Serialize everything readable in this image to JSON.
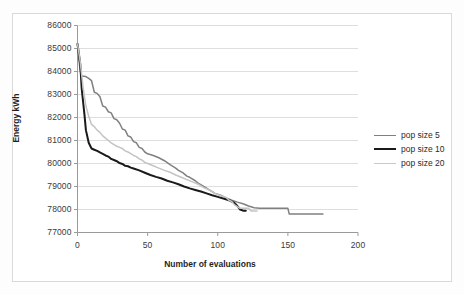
{
  "chart_data": {
    "type": "line",
    "title": "",
    "xlabel": "Number of evaluations",
    "ylabel": "Energy kWh",
    "xlim": [
      0,
      200
    ],
    "ylim": [
      77000,
      86000
    ],
    "xticks": [
      0,
      50,
      100,
      150,
      200
    ],
    "yticks": [
      77000,
      78000,
      79000,
      80000,
      81000,
      82000,
      83000,
      84000,
      85000,
      86000
    ],
    "grid": "horizontal",
    "legend_position": "right",
    "series": [
      {
        "name": "pop size 5",
        "color": "#808080",
        "width": 1.5,
        "points": [
          [
            0,
            85200
          ],
          [
            1,
            84500
          ],
          [
            2,
            84000
          ],
          [
            3,
            83800
          ],
          [
            6,
            83780
          ],
          [
            8,
            83700
          ],
          [
            10,
            83600
          ],
          [
            12,
            83100
          ],
          [
            14,
            83050
          ],
          [
            16,
            82900
          ],
          [
            18,
            82500
          ],
          [
            20,
            82450
          ],
          [
            22,
            82250
          ],
          [
            24,
            82200
          ],
          [
            26,
            81950
          ],
          [
            28,
            81900
          ],
          [
            30,
            81750
          ],
          [
            32,
            81500
          ],
          [
            34,
            81450
          ],
          [
            36,
            81200
          ],
          [
            38,
            81150
          ],
          [
            40,
            80950
          ],
          [
            42,
            80900
          ],
          [
            44,
            80700
          ],
          [
            46,
            80650
          ],
          [
            48,
            80500
          ],
          [
            50,
            80420
          ],
          [
            54,
            80350
          ],
          [
            58,
            80250
          ],
          [
            62,
            80120
          ],
          [
            66,
            79950
          ],
          [
            70,
            79800
          ],
          [
            72,
            79700
          ],
          [
            75,
            79600
          ],
          [
            78,
            79450
          ],
          [
            80,
            79400
          ],
          [
            84,
            79250
          ],
          [
            86,
            79150
          ],
          [
            90,
            79000
          ],
          [
            94,
            78850
          ],
          [
            98,
            78700
          ],
          [
            102,
            78620
          ],
          [
            106,
            78500
          ],
          [
            110,
            78400
          ],
          [
            114,
            78320
          ],
          [
            118,
            78250
          ],
          [
            122,
            78150
          ],
          [
            126,
            78080
          ],
          [
            130,
            78050
          ],
          [
            150,
            78050
          ],
          [
            151,
            77800
          ],
          [
            175,
            77800
          ]
        ]
      },
      {
        "name": "pop size 10",
        "color": "#1a1a1a",
        "width": 2.0,
        "points": [
          [
            0,
            85200
          ],
          [
            2,
            84300
          ],
          [
            3,
            83250
          ],
          [
            5,
            82100
          ],
          [
            6,
            81450
          ],
          [
            8,
            80900
          ],
          [
            10,
            80650
          ],
          [
            12,
            80600
          ],
          [
            14,
            80550
          ],
          [
            16,
            80480
          ],
          [
            18,
            80420
          ],
          [
            20,
            80350
          ],
          [
            22,
            80300
          ],
          [
            24,
            80200
          ],
          [
            26,
            80150
          ],
          [
            28,
            80100
          ],
          [
            30,
            80020
          ],
          [
            32,
            79980
          ],
          [
            34,
            79900
          ],
          [
            36,
            79880
          ],
          [
            38,
            79820
          ],
          [
            40,
            79780
          ],
          [
            44,
            79700
          ],
          [
            48,
            79600
          ],
          [
            52,
            79500
          ],
          [
            56,
            79420
          ],
          [
            60,
            79350
          ],
          [
            64,
            79250
          ],
          [
            68,
            79180
          ],
          [
            72,
            79100
          ],
          [
            76,
            79000
          ],
          [
            80,
            78920
          ],
          [
            84,
            78850
          ],
          [
            88,
            78780
          ],
          [
            92,
            78700
          ],
          [
            96,
            78620
          ],
          [
            100,
            78550
          ],
          [
            104,
            78480
          ],
          [
            108,
            78400
          ],
          [
            110,
            78350
          ],
          [
            112,
            78280
          ],
          [
            114,
            78150
          ],
          [
            116,
            78000
          ],
          [
            118,
            77950
          ],
          [
            120,
            77950
          ]
        ]
      },
      {
        "name": "pop size 20",
        "color": "#c4c4c4",
        "width": 1.5,
        "points": [
          [
            0,
            85200
          ],
          [
            2,
            84400
          ],
          [
            4,
            83300
          ],
          [
            6,
            82500
          ],
          [
            8,
            82050
          ],
          [
            10,
            81700
          ],
          [
            12,
            81600
          ],
          [
            14,
            81450
          ],
          [
            16,
            81350
          ],
          [
            18,
            81200
          ],
          [
            20,
            81100
          ],
          [
            22,
            81000
          ],
          [
            24,
            80900
          ],
          [
            26,
            80820
          ],
          [
            28,
            80750
          ],
          [
            30,
            80700
          ],
          [
            32,
            80650
          ],
          [
            34,
            80550
          ],
          [
            36,
            80500
          ],
          [
            38,
            80430
          ],
          [
            40,
            80350
          ],
          [
            42,
            80300
          ],
          [
            44,
            80200
          ],
          [
            46,
            80150
          ],
          [
            48,
            80050
          ],
          [
            50,
            80000
          ],
          [
            54,
            79900
          ],
          [
            58,
            79800
          ],
          [
            62,
            79700
          ],
          [
            66,
            79620
          ],
          [
            70,
            79500
          ],
          [
            74,
            79400
          ],
          [
            78,
            79300
          ],
          [
            82,
            79200
          ],
          [
            86,
            79100
          ],
          [
            90,
            78950
          ],
          [
            94,
            78850
          ],
          [
            98,
            78700
          ],
          [
            102,
            78600
          ],
          [
            106,
            78520
          ],
          [
            108,
            78400
          ],
          [
            110,
            78350
          ],
          [
            112,
            78200
          ],
          [
            114,
            78120
          ],
          [
            116,
            78050
          ],
          [
            122,
            78050
          ],
          [
            124,
            77930
          ],
          [
            128,
            77930
          ]
        ]
      }
    ]
  },
  "axes": {
    "y_tick_labels": [
      "86000",
      "85000",
      "84000",
      "83000",
      "82000",
      "81000",
      "80000",
      "79000",
      "78000",
      "77000"
    ],
    "x_tick_labels": [
      "0",
      "50",
      "100",
      "150",
      "200"
    ],
    "x_title": "Number of evaluations",
    "y_title": "Energy kWh"
  },
  "legend": {
    "items": [
      {
        "label": "pop size 5",
        "color": "#808080",
        "width": 1.5
      },
      {
        "label": "pop size 10",
        "color": "#1a1a1a",
        "width": 2.2
      },
      {
        "label": "pop size 20",
        "color": "#c9c9c9",
        "width": 1.5
      }
    ]
  },
  "colors": {
    "background": "#ffffff",
    "frame_border": "#d9d9d9",
    "gridline": "#d6d6d6",
    "axis": "#9a9a9a",
    "text": "#2b2b2b"
  }
}
